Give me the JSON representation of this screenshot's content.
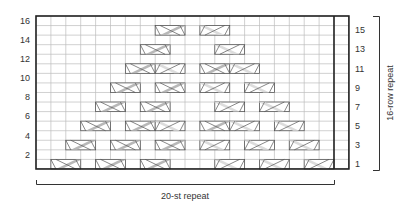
{
  "chart_data": {
    "type": "table",
    "grid": {
      "columns": 21,
      "repeat_columns": 20,
      "rows": 16
    },
    "left_row_labels": [
      "16",
      "14",
      "12",
      "10",
      "8",
      "6",
      "4",
      "2"
    ],
    "right_row_labels": [
      "15",
      "13",
      "11",
      "9",
      "7",
      "5",
      "3",
      "1"
    ],
    "horizontal_repeat_label": "20-st repeat",
    "vertical_repeat_label": "16-row repeat",
    "cables": [
      {
        "row": 1,
        "col": 2,
        "type": "dark"
      },
      {
        "row": 1,
        "col": 5,
        "type": "dark"
      },
      {
        "row": 1,
        "col": 8,
        "type": "dark"
      },
      {
        "row": 1,
        "col": 13,
        "type": "light"
      },
      {
        "row": 1,
        "col": 16,
        "type": "light"
      },
      {
        "row": 1,
        "col": 19,
        "type": "light"
      },
      {
        "row": 3,
        "col": 3,
        "type": "dark"
      },
      {
        "row": 3,
        "col": 6,
        "type": "dark"
      },
      {
        "row": 3,
        "col": 9,
        "type": "dark"
      },
      {
        "row": 3,
        "col": 12,
        "type": "light"
      },
      {
        "row": 3,
        "col": 15,
        "type": "light"
      },
      {
        "row": 3,
        "col": 18,
        "type": "light"
      },
      {
        "row": 5,
        "col": 4,
        "type": "dark"
      },
      {
        "row": 5,
        "col": 7,
        "type": "dark"
      },
      {
        "row": 5,
        "col": 9,
        "type": "light"
      },
      {
        "row": 5,
        "col": 12,
        "type": "dark"
      },
      {
        "row": 5,
        "col": 14,
        "type": "light"
      },
      {
        "row": 5,
        "col": 17,
        "type": "light"
      },
      {
        "row": 7,
        "col": 5,
        "type": "dark"
      },
      {
        "row": 7,
        "col": 8,
        "type": "dark"
      },
      {
        "row": 7,
        "col": 13,
        "type": "light"
      },
      {
        "row": 7,
        "col": 16,
        "type": "light"
      },
      {
        "row": 9,
        "col": 6,
        "type": "dark"
      },
      {
        "row": 9,
        "col": 9,
        "type": "dark"
      },
      {
        "row": 9,
        "col": 12,
        "type": "light"
      },
      {
        "row": 9,
        "col": 15,
        "type": "light"
      },
      {
        "row": 11,
        "col": 7,
        "type": "dark"
      },
      {
        "row": 11,
        "col": 9,
        "type": "light"
      },
      {
        "row": 11,
        "col": 12,
        "type": "dark"
      },
      {
        "row": 11,
        "col": 14,
        "type": "light"
      },
      {
        "row": 13,
        "col": 8,
        "type": "dark"
      },
      {
        "row": 13,
        "col": 13,
        "type": "light"
      },
      {
        "row": 15,
        "col": 9,
        "type": "dark"
      },
      {
        "row": 15,
        "col": 12,
        "type": "light"
      }
    ],
    "colors": {
      "dark_cable": "#b8b8b8",
      "light_cable": "#dcdcdc",
      "grid_line": "#bdbdbd",
      "border": "#222222"
    }
  }
}
